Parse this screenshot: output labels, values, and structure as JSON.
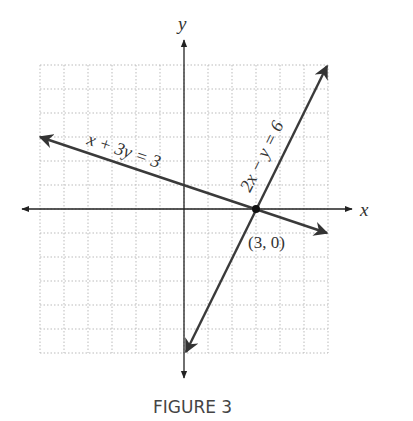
{
  "figure": {
    "caption": "FIGURE 3",
    "x_axis_label": "x",
    "y_axis_label": "y",
    "line1_label": "x + 3y = 3",
    "line2_label": "2x − y = 6",
    "point_label": "(3, 0)"
  },
  "colors": {
    "axis": "#222222",
    "line": "#3a3a3a",
    "grid": "#bbbbbb"
  },
  "chart_data": {
    "type": "line",
    "title": "FIGURE 3",
    "xlabel": "x",
    "ylabel": "y",
    "xlim": [
      -6,
      6
    ],
    "ylim": [
      -6,
      6
    ],
    "grid": true,
    "legend": null,
    "series": [
      {
        "name": "x + 3y = 3",
        "x": [
          -6,
          6
        ],
        "y": [
          3,
          -1
        ]
      },
      {
        "name": "2x − y = 6",
        "x": [
          0,
          6
        ],
        "y": [
          -6,
          6
        ]
      }
    ],
    "annotations": [
      {
        "text": "(3, 0)",
        "x": 3,
        "y": 0,
        "marker": "point"
      }
    ]
  }
}
